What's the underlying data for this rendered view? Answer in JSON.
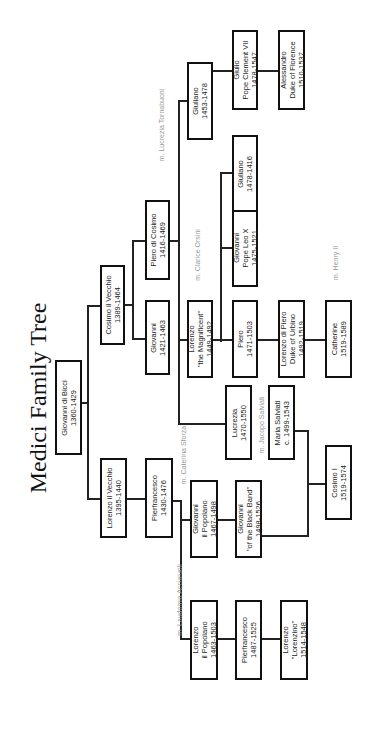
{
  "title": "Medici Family Tree",
  "orientation": "rotated 90° counter-clockwise",
  "people": {
    "giovanni_di_bicci": {
      "name": "Giovanni di Bicci",
      "dates": "1360-1429"
    },
    "cosimo_il_vecchio": {
      "name": "Cosimo il Vecchio",
      "dates": "1389-1464"
    },
    "lorenzo_il_vecchio": {
      "name": "Lorenzo il Vecchio",
      "dates": "1395-1440"
    },
    "giovanni_1421": {
      "name": "Giovanni",
      "dates": "1421-1463"
    },
    "piero_di_cosimo": {
      "name": "Piero di Cosimo",
      "dates": "1416-1469"
    },
    "pierfrancesco_1430": {
      "name": "Pierfrancesco",
      "dates": "1430-1476"
    },
    "lorenzo_magnificent": {
      "name": "Lorenzo",
      "epithet": "\"the Magnificent\"",
      "dates": "1449-1492"
    },
    "giuliano_1453": {
      "name": "Giuliano",
      "dates": "1453-1478"
    },
    "lucrezia": {
      "name": "Lucrezia",
      "dates": "1470-1550"
    },
    "piero_1471": {
      "name": "Piero",
      "dates": "1471-1503"
    },
    "giovanni_leo_x": {
      "name": "Giovanni",
      "epithet": "Pope Leo X",
      "dates": "1475-1521"
    },
    "giuliano_1478": {
      "name": "Giuliano",
      "dates": "1478-1416"
    },
    "giulio": {
      "name": "Giulio",
      "epithet": "Pope Clement VII",
      "dates": "1478-1547"
    },
    "giovanni_popolano": {
      "name": "Giovanni",
      "epithet": "il Popolano",
      "dates": "1467-1498"
    },
    "giovanni_black_band": {
      "name": "Giovanni",
      "epithet": "\"of the Black Band\"",
      "dates": "1498-1526"
    },
    "lorenzo_popolano": {
      "name": "Lorenzo",
      "epithet": "il Popolano",
      "dates": "1463-1503"
    },
    "pierfrancesco_1487": {
      "name": "Pierfrancesco",
      "dates": "1487-1525"
    },
    "lorenzo_lorenzino": {
      "name": "Lorenzo",
      "epithet": "\"Lorenzino\"",
      "dates": "1514-1548"
    },
    "maria_salviati": {
      "name": "Maria Salviati",
      "dates": "c. 1499-1543"
    },
    "lorenzo_di_piero": {
      "name": "Lorenzo di Piero",
      "epithet": "Duke of Urbino",
      "dates": "1492-1519"
    },
    "alessandro": {
      "name": "Alessandro",
      "epithet": "Duke of Florence",
      "dates": "1510-1537"
    },
    "cosimo_i": {
      "name": "Cosimo I",
      "dates": "1519-1574"
    },
    "catherine": {
      "name": "Catherine",
      "dates": "1519-1589"
    }
  },
  "marriages": {
    "laudomia": "m. Laudomia Acciaiuoli",
    "caterina": "m. Caterina Sforza",
    "jacopo": "m. Jacopo Salviati",
    "clarice": "m. Clarice Orsini",
    "lucrezia_t": "m. Lucrezia Tornabuoni",
    "henry": "m. Henry II"
  }
}
